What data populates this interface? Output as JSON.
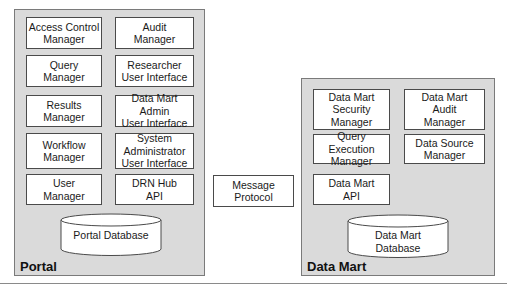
{
  "portal": {
    "label": "Portal",
    "components": [
      {
        "label": "Access Control\nManager"
      },
      {
        "label": "Audit\nManager"
      },
      {
        "label": "Query\nManager"
      },
      {
        "label": "Researcher\nUser Interface"
      },
      {
        "label": "Results\nManager"
      },
      {
        "label": "Data Mart Admin\nUser Interface"
      },
      {
        "label": "Workflow\nManager"
      },
      {
        "label": "System\nAdministrator\nUser Interface"
      },
      {
        "label": "User\nManager"
      },
      {
        "label": "DRN Hub\nAPI"
      }
    ],
    "database": {
      "label": "Portal Database"
    }
  },
  "connector": {
    "label": "Message\nProtocol"
  },
  "data_mart": {
    "label": "Data Mart",
    "components": [
      {
        "label": "Data Mart\nSecurity\nManager"
      },
      {
        "label": "Data Mart\nAudit\nManager"
      },
      {
        "label": "Query Execution\nManager"
      },
      {
        "label": "Data Source\nManager"
      },
      {
        "label": "Data Mart\nAPI"
      }
    ],
    "database": {
      "label": "Data Mart\nDatabase"
    }
  },
  "colors": {
    "panel_fill": "#dadada",
    "box_fill": "#ffffff",
    "border": "#4a4a4a"
  }
}
